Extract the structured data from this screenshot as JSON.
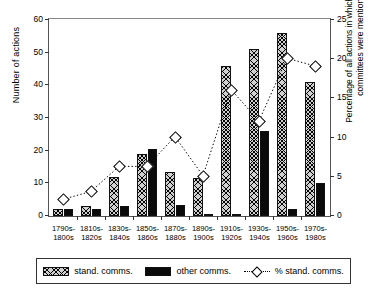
{
  "chart_data": {
    "type": "bar",
    "title": "",
    "xlabel": "",
    "ylabel": "Number of actions",
    "y2label": "Percentage of all actions in which standing committees were mentioned",
    "ylim": [
      0,
      60
    ],
    "y2lim": [
      0,
      25
    ],
    "yticks": [
      0,
      10,
      20,
      30,
      40,
      50,
      60
    ],
    "y2ticks": [
      0,
      5,
      10,
      15,
      20,
      25
    ],
    "grid": false,
    "legend_position": "bottom",
    "categories": [
      "1790s-\n1800s",
      "1810s-\n1820s",
      "1830s-\n1840s",
      "1850s-\n1860s",
      "1870s-\n1880s",
      "1890s-\n1900s",
      "1910s-\n1920s",
      "1930s-\n1940s",
      "1950s-\n1960s",
      "1970s-\n1980s"
    ],
    "category_lines": [
      [
        "1790s-",
        "1800s"
      ],
      [
        "1810s-",
        "1820s"
      ],
      [
        "1830s-",
        "1840s"
      ],
      [
        "1850s-",
        "1860s"
      ],
      [
        "1870s-",
        "1880s"
      ],
      [
        "1890s-",
        "1900s"
      ],
      [
        "1910s-",
        "1920s"
      ],
      [
        "1930s-",
        "1940s"
      ],
      [
        "1950s-",
        "1960s"
      ],
      [
        "1970s-",
        "1980s"
      ]
    ],
    "series": [
      {
        "name": "stand. comms.",
        "axis": "left",
        "kind": "bar",
        "values": [
          2,
          3,
          12,
          19,
          13.5,
          11.5,
          46,
          51,
          56,
          41
        ]
      },
      {
        "name": "other comms.",
        "axis": "left",
        "kind": "bar",
        "values": [
          2,
          2,
          3,
          20.5,
          3.5,
          0.5,
          0.5,
          26,
          2,
          10
        ]
      },
      {
        "name": "% stand. comms.",
        "axis": "right",
        "kind": "line",
        "values": [
          2,
          3,
          6.2,
          6.2,
          10,
          5,
          16,
          12,
          20,
          19
        ]
      }
    ]
  },
  "legend": {
    "items": [
      {
        "label": "stand. comms.",
        "swatch": "hatched-square"
      },
      {
        "label": "other comms.",
        "swatch": "filled-square"
      },
      {
        "label": "% stand. comms.",
        "swatch": "dotted-line-diamond"
      }
    ]
  },
  "colors": {
    "stand_comms": "#cfcfcf",
    "other_comms": "#0a0a0a",
    "line": "#000000",
    "axis": "#555555"
  }
}
